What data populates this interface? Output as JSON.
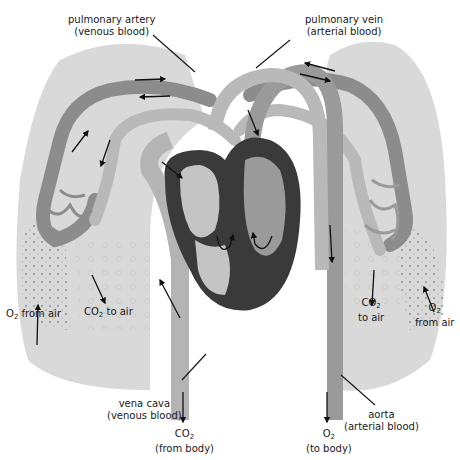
{
  "diagram": {
    "colors": {
      "background": "#ffffff",
      "lung": "#d9d9d9",
      "vein_arterial_blood": "#b9b9b9",
      "artery_venous_blood": "#8c8c8c",
      "heart_wall": "#3a3a3a",
      "heart_chamber_light": "#c4c4c4",
      "heart_chamber_dark": "#9a9a9a",
      "arrow": "#111111"
    },
    "labels": {
      "pulmonary_artery": {
        "line1": "pulmonary artery",
        "line2": "(venous blood)"
      },
      "pulmonary_vein": {
        "line1": "pulmonary vein",
        "line2": "(arterial blood)"
      },
      "left_o2": {
        "gas": "O",
        "sub": "2",
        "text": " from air"
      },
      "left_co2": {
        "gas": "CO",
        "sub": "2",
        "text": " to air"
      },
      "right_co2": {
        "gas": "CO",
        "sub": "2",
        "line2": "to air"
      },
      "right_o2": {
        "gas": "O",
        "sub": "2",
        "line2": "from air"
      },
      "vena_cava": {
        "line1": "vena cava",
        "line2": "(venous blood)"
      },
      "aorta": {
        "line1": "aorta",
        "line2": "(arterial blood)"
      },
      "co2_from_body": {
        "gas": "CO",
        "sub": "2",
        "line2": "(from body)"
      },
      "o2_to_body": {
        "gas": "O",
        "sub": "2",
        "line2": "(to body)"
      }
    },
    "structures": [
      "left lung",
      "right lung",
      "heart",
      "pulmonary artery",
      "pulmonary vein",
      "vena cava",
      "aorta",
      "capillaries"
    ]
  }
}
